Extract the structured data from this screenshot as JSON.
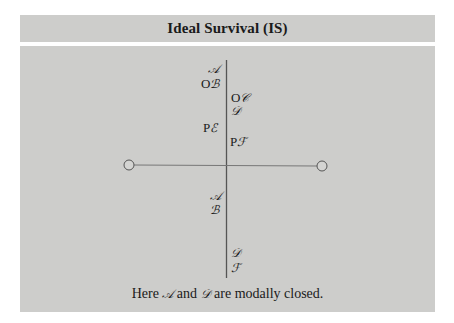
{
  "header": {
    "title": "Ideal Survival (IS)"
  },
  "diagram": {
    "above_left": [
      {
        "prefix": "",
        "symbol": "𝒜",
        "top": 62,
        "left": 208
      },
      {
        "prefix": "O",
        "symbol": "ℬ",
        "top": 77,
        "left": 201
      },
      {
        "prefix": "P",
        "symbol": "ℰ",
        "top": 121,
        "left": 203
      }
    ],
    "above_right": [
      {
        "prefix": "O",
        "symbol": "𝒞",
        "top": 91,
        "left": 231
      },
      {
        "prefix": "",
        "symbol": "𝒟",
        "top": 104,
        "left": 231
      },
      {
        "prefix": "P",
        "symbol": "ℱ",
        "top": 135,
        "left": 230
      }
    ],
    "below_left": [
      {
        "prefix": "",
        "symbol": "𝒜",
        "top": 189,
        "left": 210
      },
      {
        "prefix": "",
        "symbol": "ℬ",
        "top": 203,
        "left": 210
      }
    ],
    "below_right": [
      {
        "prefix": "",
        "symbol": "𝒟",
        "top": 246,
        "left": 231
      },
      {
        "prefix": "",
        "symbol": "ℱ",
        "top": 261,
        "left": 231
      }
    ],
    "line_color": "#555555"
  },
  "caption": {
    "text_before": "Here ",
    "sym1": "𝒜",
    "text_mid": " and ",
    "sym2": "𝒟",
    "text_after": " are modally closed."
  }
}
